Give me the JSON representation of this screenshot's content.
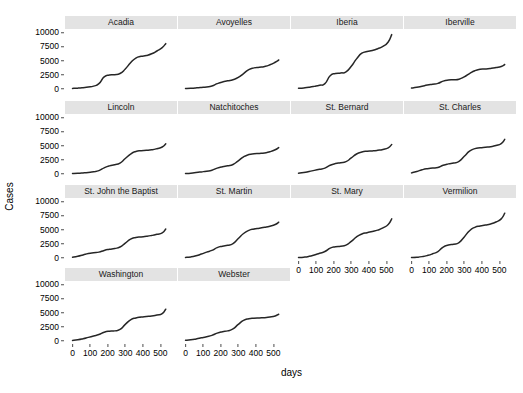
{
  "chart_data": {
    "type": "line",
    "title": "",
    "xlabel": "days",
    "ylabel": "Cases",
    "xlim": [
      -20,
      560
    ],
    "ylim": [
      -400,
      10600
    ],
    "grid": false,
    "legend": "none",
    "facet_layout": {
      "ncol": 4,
      "nrow": 4
    },
    "y_ticks": [
      0,
      2500,
      5000,
      7500,
      10000
    ],
    "y_tick_labels": [
      "0",
      "2500",
      "5000",
      "7500",
      "10000"
    ],
    "x_ticks": [
      0,
      100,
      200,
      300,
      400,
      500
    ],
    "x_tick_labels": [
      "0",
      "100",
      "200",
      "300",
      "400",
      "500"
    ],
    "line_color": "#262626",
    "strip_color": "#e3e3e3",
    "panel_color": "#ffffff",
    "x": [
      0,
      30,
      60,
      90,
      120,
      150,
      180,
      210,
      240,
      270,
      300,
      330,
      360,
      390,
      420,
      450,
      480,
      510,
      530
    ],
    "series": [
      {
        "name": "Acadia",
        "values": [
          60,
          110,
          190,
          300,
          470,
          900,
          2100,
          2450,
          2500,
          2700,
          3500,
          4600,
          5450,
          5750,
          5900,
          6200,
          6700,
          7300,
          8000
        ]
      },
      {
        "name": "Avoyelles",
        "values": [
          50,
          90,
          150,
          230,
          330,
          500,
          900,
          1200,
          1400,
          1600,
          2000,
          2700,
          3400,
          3700,
          3800,
          3950,
          4250,
          4700,
          5100
        ]
      },
      {
        "name": "Iberia",
        "values": [
          80,
          150,
          260,
          420,
          620,
          900,
          2300,
          2700,
          2800,
          3000,
          4000,
          5300,
          6300,
          6600,
          6800,
          7100,
          7500,
          8300,
          9600
        ]
      },
      {
        "name": "Iberville",
        "values": [
          120,
          260,
          450,
          650,
          800,
          950,
          1350,
          1550,
          1600,
          1700,
          2100,
          2700,
          3200,
          3450,
          3500,
          3600,
          3750,
          3950,
          4300
        ]
      },
      {
        "name": "Lincoln",
        "values": [
          40,
          80,
          150,
          240,
          360,
          560,
          1050,
          1400,
          1600,
          1900,
          2700,
          3500,
          3950,
          4100,
          4150,
          4250,
          4450,
          4750,
          5300
        ]
      },
      {
        "name": "Natchitoches",
        "values": [
          50,
          110,
          210,
          330,
          460,
          620,
          1000,
          1250,
          1400,
          1650,
          2300,
          3000,
          3400,
          3550,
          3600,
          3700,
          3900,
          4250,
          4650
        ]
      },
      {
        "name": "St. Bernard",
        "values": [
          100,
          220,
          400,
          600,
          800,
          1000,
          1500,
          1800,
          1950,
          2150,
          2800,
          3500,
          3850,
          4000,
          4050,
          4150,
          4300,
          4600,
          5200
        ]
      },
      {
        "name": "St. Charles",
        "values": [
          150,
          400,
          700,
          900,
          1000,
          1100,
          1500,
          1750,
          1900,
          2200,
          3100,
          4000,
          4450,
          4600,
          4700,
          4800,
          5000,
          5350,
          6100
        ]
      },
      {
        "name": "St. John the Baptist",
        "values": [
          90,
          250,
          500,
          750,
          900,
          1000,
          1300,
          1500,
          1650,
          1900,
          2600,
          3300,
          3600,
          3700,
          3800,
          3950,
          4150,
          4400,
          5100
        ]
      },
      {
        "name": "St. Martin",
        "values": [
          60,
          150,
          350,
          650,
          1000,
          1300,
          1800,
          2050,
          2200,
          2500,
          3400,
          4300,
          4850,
          5100,
          5250,
          5400,
          5600,
          5900,
          6300
        ]
      },
      {
        "name": "St. Mary",
        "values": [
          40,
          100,
          250,
          500,
          800,
          1100,
          1700,
          1950,
          2050,
          2250,
          2900,
          3700,
          4200,
          4450,
          4650,
          4900,
          5300,
          5900,
          6900
        ]
      },
      {
        "name": "Vermilion",
        "values": [
          50,
          90,
          200,
          400,
          700,
          1100,
          1900,
          2250,
          2400,
          2700,
          3700,
          4800,
          5400,
          5650,
          5800,
          6000,
          6350,
          6900,
          7900
        ]
      },
      {
        "name": "Washington",
        "values": [
          50,
          160,
          350,
          600,
          850,
          1100,
          1500,
          1700,
          1750,
          2000,
          2900,
          3700,
          4050,
          4200,
          4300,
          4400,
          4550,
          4800,
          5600
        ]
      },
      {
        "name": "Webster",
        "values": [
          90,
          180,
          330,
          520,
          720,
          950,
          1350,
          1600,
          1750,
          2100,
          2900,
          3600,
          3900,
          4000,
          4050,
          4100,
          4200,
          4400,
          4700
        ]
      }
    ]
  },
  "axes": {
    "y_title": "Cases",
    "x_title": "days"
  }
}
